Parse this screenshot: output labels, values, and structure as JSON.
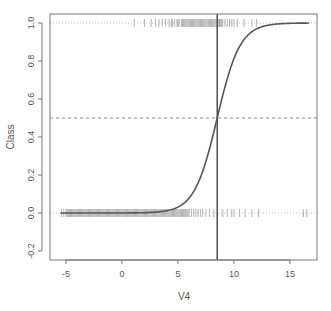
{
  "chart_data": {
    "type": "scatter",
    "title": "",
    "xlabel": "V4",
    "ylabel": "Class",
    "xlim": [
      -6.0,
      17.5
    ],
    "ylim": [
      -0.24,
      1.04
    ],
    "x_ticks": [
      -5,
      0,
      5,
      10,
      15
    ],
    "x_tick_labels": [
      "-5",
      "0",
      "5",
      "10",
      "15"
    ],
    "y_ticks": [
      -0.2,
      0.0,
      0.2,
      0.4,
      0.6,
      0.8,
      1.0
    ],
    "y_tick_labels": [
      "-0.2",
      "0.0",
      "0.2",
      "0.4",
      "0.6",
      "0.8",
      "1.0"
    ],
    "grid": false,
    "legend": null,
    "reference_lines": {
      "horizontal_dashed_y": 0.5,
      "horizontal_dotted_y": [
        0.0,
        1.0
      ],
      "vertical_solid_x": 8.5
    },
    "logistic_curve": {
      "description": "Fitted logistic probability curve",
      "midpoint": 8.5,
      "slope": 0.98,
      "x_range": [
        -5.5,
        16.7
      ]
    },
    "series": [
      {
        "name": "Class 0",
        "y": 0.0,
        "marker": "|",
        "x": [
          -5.4,
          -5.2,
          -5.0,
          -4.9,
          -4.8,
          -4.7,
          -4.6,
          -4.5,
          -4.4,
          -4.3,
          -4.2,
          -4.1,
          -4.0,
          -3.9,
          -3.8,
          -3.7,
          -3.6,
          -3.5,
          -3.4,
          -3.3,
          -3.2,
          -3.1,
          -3.0,
          -2.9,
          -2.8,
          -2.7,
          -2.6,
          -2.5,
          -2.4,
          -2.3,
          -2.2,
          -2.1,
          -2.0,
          -1.9,
          -1.8,
          -1.7,
          -1.6,
          -1.5,
          -1.4,
          -1.3,
          -1.2,
          -1.1,
          -1.0,
          -0.9,
          -0.8,
          -0.7,
          -0.6,
          -0.5,
          -0.4,
          -0.3,
          -0.2,
          -0.1,
          0.0,
          0.1,
          0.2,
          0.3,
          0.4,
          0.5,
          0.6,
          0.7,
          0.8,
          0.9,
          1.0,
          1.1,
          1.2,
          1.3,
          1.4,
          1.5,
          1.6,
          1.7,
          1.8,
          1.9,
          2.0,
          2.1,
          2.2,
          2.3,
          2.4,
          2.5,
          2.6,
          2.7,
          2.8,
          2.9,
          3.0,
          3.1,
          3.2,
          3.3,
          3.4,
          3.5,
          3.6,
          3.7,
          3.8,
          3.9,
          4.0,
          4.1,
          4.2,
          4.3,
          4.4,
          4.5,
          4.6,
          4.7,
          4.8,
          4.9,
          5.0,
          5.1,
          5.2,
          5.3,
          5.4,
          5.5,
          5.6,
          5.7,
          5.8,
          5.9,
          6.0,
          6.2,
          6.4,
          6.6,
          6.8,
          7.0,
          7.2,
          7.5,
          7.8,
          8.2,
          9.0,
          9.4,
          9.8,
          10.0,
          10.5,
          11.0,
          11.6,
          12.2,
          16.2,
          16.5
        ]
      },
      {
        "name": "Class 1",
        "y": 1.0,
        "marker": "|",
        "x": [
          1.1,
          2.0,
          2.6,
          3.0,
          3.3,
          3.6,
          3.9,
          4.2,
          4.4,
          4.5,
          4.7,
          4.9,
          5.0,
          5.1,
          5.3,
          5.4,
          5.5,
          5.6,
          5.7,
          5.8,
          5.9,
          6.0,
          6.1,
          6.2,
          6.3,
          6.4,
          6.5,
          6.6,
          6.7,
          6.8,
          6.9,
          7.0,
          7.1,
          7.2,
          7.3,
          7.4,
          7.5,
          7.6,
          7.7,
          7.8,
          7.9,
          8.0,
          8.1,
          8.2,
          8.3,
          8.4,
          8.6,
          8.7,
          8.8,
          8.9,
          9.0,
          9.2,
          9.4,
          9.6,
          9.8,
          10.0,
          10.3,
          10.9,
          11.6,
          12.0
        ]
      }
    ]
  }
}
